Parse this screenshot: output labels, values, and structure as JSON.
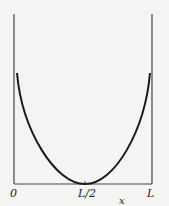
{
  "figure": {
    "type": "potential well curve (U-shaped) between two walls",
    "x_axis": {
      "label": "x",
      "ticks": [
        "0",
        "L/2",
        "L"
      ]
    },
    "curve": {
      "shape": "symmetric U, minimum at L/2 touching axis, rising toward walls",
      "color": "#1a1a1a"
    },
    "walls": {
      "color": "#444444"
    }
  }
}
